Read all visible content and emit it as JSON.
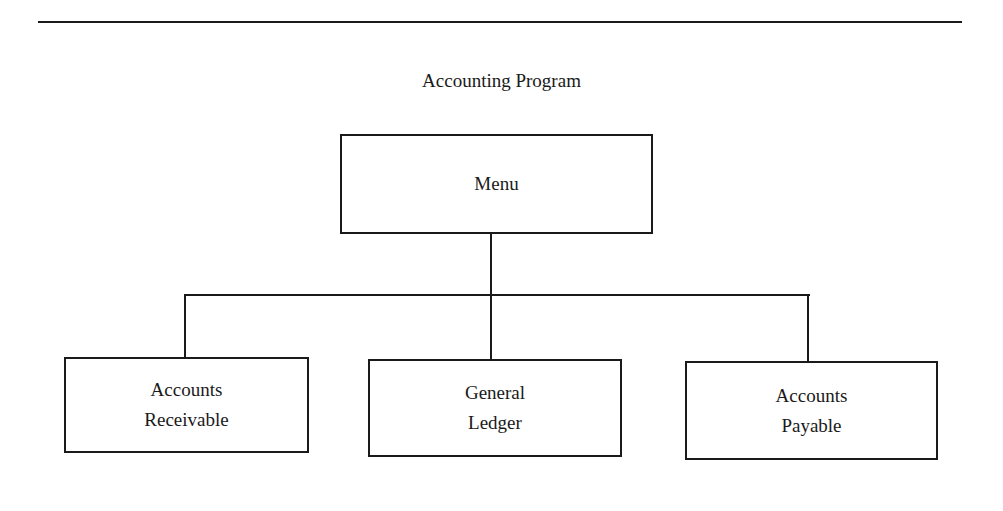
{
  "diagram": {
    "title": "Accounting Program",
    "type": "hierarchy-chart",
    "root": {
      "id": "menu",
      "label": "Menu"
    },
    "children": [
      {
        "id": "accounts-receivable",
        "label": "Accounts\nReceivable"
      },
      {
        "id": "general-ledger",
        "label": "General\nLedger"
      },
      {
        "id": "accounts-payable",
        "label": "Accounts\nPayable"
      }
    ],
    "edges": [
      {
        "from": "menu",
        "to": "accounts-receivable"
      },
      {
        "from": "menu",
        "to": "general-ledger"
      },
      {
        "from": "menu",
        "to": "accounts-payable"
      }
    ]
  }
}
